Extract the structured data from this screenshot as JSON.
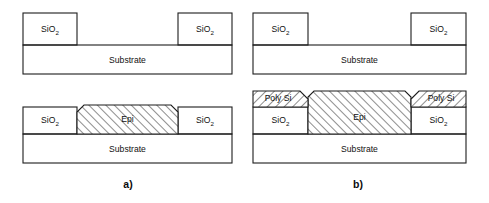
{
  "figure": {
    "background_color": "#ffffff",
    "line_color": "#1d1d1d",
    "oxide_fill_color": "#e4e4e4",
    "substrate_fill_color": "#ffffff",
    "hatch_fill_color": "#ffffff"
  },
  "labels": {
    "sio2": "SiO",
    "sio2_subscript": "2",
    "substrate": "Substrate",
    "epi": "Epi",
    "poly_si": "Poly Si"
  },
  "panels": [
    {
      "id": "a",
      "caption": "a)",
      "caption_x": 128,
      "caption_y": 185,
      "steps": [
        {
          "id": "a-top",
          "name": "patterned-oxide-on-substrate",
          "substrate": {
            "x": 23,
            "y": 45,
            "width": 209,
            "height": 29,
            "label": "Substrate"
          },
          "oxide_blocks": [
            {
              "x": 23,
              "y": 13,
              "width": 54,
              "height": 32,
              "label": "SiO",
              "sub": "2"
            },
            {
              "x": 178,
              "y": 13,
              "width": 54,
              "height": 32,
              "label": "SiO",
              "sub": "2"
            }
          ],
          "epi": null,
          "poly": []
        },
        {
          "id": "a-bottom",
          "name": "selective-epitaxial-fill",
          "substrate": {
            "x": 23,
            "y": 134,
            "width": 209,
            "height": 29,
            "label": "Substrate"
          },
          "oxide_blocks": [
            {
              "x": 23,
              "y": 107,
              "width": 54,
              "height": 27,
              "label": "SiO",
              "sub": "2"
            },
            {
              "x": 178,
              "y": 107,
              "width": 54,
              "height": 27,
              "label": "SiO",
              "sub": "2"
            }
          ],
          "epi": {
            "x": 77,
            "y": 105,
            "width": 101,
            "height": 29,
            "chamfer": 7,
            "label": "Epi",
            "hatch": "forward"
          },
          "poly": []
        }
      ]
    },
    {
      "id": "b",
      "caption": "b)",
      "caption_x": 358,
      "caption_y": 185,
      "steps": [
        {
          "id": "b-top",
          "name": "patterned-oxide-on-substrate",
          "substrate": {
            "x": 253,
            "y": 45,
            "width": 213,
            "height": 29,
            "label": "Substrate"
          },
          "oxide_blocks": [
            {
              "x": 253,
              "y": 13,
              "width": 55,
              "height": 32,
              "label": "SiO",
              "sub": "2"
            },
            {
              "x": 411,
              "y": 13,
              "width": 55,
              "height": 32,
              "label": "SiO",
              "sub": "2"
            }
          ],
          "epi": null,
          "poly": []
        },
        {
          "id": "b-bottom",
          "name": "non-selective-epi-with-polysilicon",
          "substrate": {
            "x": 253,
            "y": 134,
            "width": 213,
            "height": 29,
            "label": "Substrate"
          },
          "oxide_blocks": [
            {
              "x": 253,
              "y": 107,
              "width": 55,
              "height": 27,
              "label": "SiO",
              "sub": "2"
            },
            {
              "x": 411,
              "y": 107,
              "width": 55,
              "height": 27,
              "label": "SiO",
              "sub": "2"
            }
          ],
          "epi": {
            "x": 308,
            "y": 91,
            "width": 103,
            "height": 43,
            "chamfer": 0,
            "label": "Epi",
            "hatch": "forward"
          },
          "poly": [
            {
              "x": 253,
              "y": 91,
              "width": 55,
              "height": 16,
              "label": "Poly Si",
              "hatch": "backward",
              "chamfer_side": "right"
            },
            {
              "x": 411,
              "y": 91,
              "width": 55,
              "height": 16,
              "label": "Poly Si",
              "hatch": "backward",
              "chamfer_side": "left"
            }
          ]
        }
      ]
    }
  ]
}
